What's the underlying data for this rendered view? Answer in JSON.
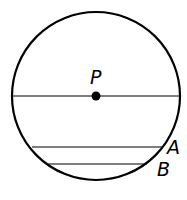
{
  "diagram": {
    "circle": {
      "cx": 96,
      "cy": 96,
      "r": 84
    },
    "center": {
      "label": "P",
      "x": 96,
      "y": 96
    },
    "chords": [
      {
        "name": "diameter",
        "y": 96,
        "x1": 12,
        "x2": 180
      },
      {
        "name": "A",
        "label": "A",
        "y": 147,
        "x1": 32,
        "x2": 163
      },
      {
        "name": "B",
        "label": "B",
        "y": 164,
        "x1": 48,
        "x2": 147
      }
    ],
    "labels": {
      "P": "P",
      "A": "A",
      "B": "B"
    }
  }
}
